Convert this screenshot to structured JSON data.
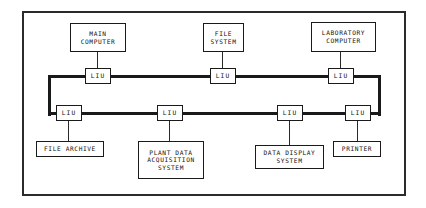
{
  "diagram": {
    "frame": {
      "x": 22,
      "y": 11,
      "w": 384,
      "h": 185
    },
    "colors": {
      "frame_border": "#2b2b2b",
      "bus_line": "#1a1a1a",
      "box_border": "#1a1a1a",
      "lead_line": "#2a2a2a",
      "background": "#ffffff",
      "text": "#101010"
    },
    "bus": {
      "label": "network-bus-loop",
      "topology": "loop",
      "thickness": 3,
      "top_y": 76,
      "bottom_y": 113,
      "left_x": 48,
      "right_x": 381,
      "segments": [
        {
          "name": "bus-top-run",
          "orientation": "horizontal",
          "x": 48,
          "y": 75,
          "w": 333,
          "h": 3
        },
        {
          "name": "bus-left-riser",
          "orientation": "vertical",
          "x": 48,
          "y": 75,
          "w": 3,
          "h": 41
        },
        {
          "name": "bus-bottom-run",
          "orientation": "horizontal",
          "x": 48,
          "y": 112,
          "w": 333,
          "h": 3
        },
        {
          "name": "bus-right-riser",
          "orientation": "vertical",
          "x": 378,
          "y": 75,
          "w": 3,
          "h": 41
        }
      ]
    },
    "liu_units": [
      {
        "id": "liu-main-computer",
        "label": "LIU",
        "x": 85,
        "y": 68,
        "w": 26,
        "h": 16,
        "row": "top"
      },
      {
        "id": "liu-file-system",
        "label": "LIU",
        "x": 210,
        "y": 68,
        "w": 26,
        "h": 16,
        "row": "top"
      },
      {
        "id": "liu-laboratory-computer",
        "label": "LIU",
        "x": 328,
        "y": 68,
        "w": 26,
        "h": 16,
        "row": "top"
      },
      {
        "id": "liu-file-archive",
        "label": "LIU",
        "x": 56,
        "y": 105,
        "w": 26,
        "h": 16,
        "row": "bottom"
      },
      {
        "id": "liu-plant-data",
        "label": "LIU",
        "x": 157,
        "y": 105,
        "w": 26,
        "h": 16,
        "row": "bottom"
      },
      {
        "id": "liu-data-display",
        "label": "LIU",
        "x": 277,
        "y": 105,
        "w": 26,
        "h": 16,
        "row": "bottom"
      },
      {
        "id": "liu-printer",
        "label": "LIU",
        "x": 345,
        "y": 105,
        "w": 26,
        "h": 16,
        "row": "bottom"
      }
    ],
    "devices": [
      {
        "id": "main-computer",
        "lines": [
          "MAIN",
          "COMPUTER"
        ],
        "x": 70,
        "y": 23,
        "w": 56,
        "h": 29,
        "lead": {
          "x": 97,
          "y": 52,
          "w": 1,
          "h": 17
        }
      },
      {
        "id": "file-system",
        "lines": [
          "FILE",
          "SYSTEM"
        ],
        "x": 203,
        "y": 23,
        "w": 41,
        "h": 29,
        "lead": {
          "x": 222,
          "y": 52,
          "w": 1,
          "h": 17
        }
      },
      {
        "id": "laboratory-computer",
        "lines": [
          "LABORATORY",
          "COMPUTER"
        ],
        "x": 311,
        "y": 22,
        "w": 65,
        "h": 30,
        "lead": {
          "x": 340,
          "y": 52,
          "w": 1,
          "h": 17
        }
      },
      {
        "id": "file-archive",
        "lines": [
          "FILE ARCHIVE"
        ],
        "x": 36,
        "y": 141,
        "w": 68,
        "h": 16,
        "lead": {
          "x": 68,
          "y": 121,
          "w": 1,
          "h": 21
        }
      },
      {
        "id": "plant-data-acquisition-system",
        "lines": [
          "PLANT DATA",
          "ACQUISITION",
          "SYSTEM"
        ],
        "x": 138,
        "y": 141,
        "w": 66,
        "h": 38,
        "lead": {
          "x": 169,
          "y": 121,
          "w": 1,
          "h": 21
        }
      },
      {
        "id": "data-display-system",
        "lines": [
          "DATA DISPLAY",
          "SYSTEM"
        ],
        "x": 255,
        "y": 145,
        "w": 69,
        "h": 24,
        "lead": {
          "x": 289,
          "y": 121,
          "w": 1,
          "h": 25
        }
      },
      {
        "id": "printer",
        "lines": [
          "PRINTER"
        ],
        "x": 333,
        "y": 141,
        "w": 48,
        "h": 16,
        "lead": {
          "x": 357,
          "y": 121,
          "w": 1,
          "h": 21
        }
      }
    ]
  }
}
